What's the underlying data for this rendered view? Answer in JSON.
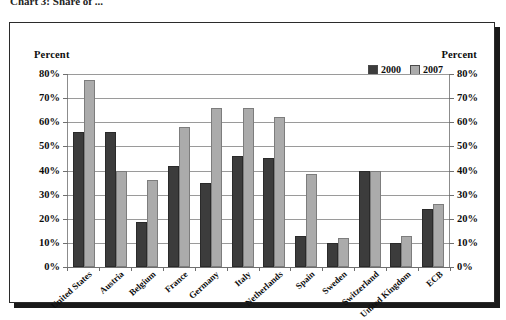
{
  "caption": {
    "clipped_top_text": "Chart 3: Share of ...",
    "visible": true
  },
  "axis_caption": {
    "left": "Percent",
    "right": "Percent"
  },
  "legend": {
    "position": "top-right",
    "items": [
      {
        "label": "2000",
        "color": "#3c3c3c",
        "swatch": "legend-swatch-2000"
      },
      {
        "label": "2007",
        "color": "#ababab",
        "swatch": "legend-swatch-2007"
      }
    ]
  },
  "chart_data": {
    "type": "bar",
    "title": "",
    "xlabel": "",
    "ylabel": "Percent",
    "ylim": [
      0,
      80
    ],
    "ytick_labels": [
      "80%",
      "70%",
      "60%",
      "50%",
      "40%",
      "30%",
      "20%",
      "10%",
      "0%"
    ],
    "ytick_values": [
      80,
      70,
      60,
      50,
      40,
      30,
      20,
      10,
      0
    ],
    "grid": true,
    "dual_axis": true,
    "categories": [
      "United States",
      "Austria",
      "Belgium",
      "France",
      "Germany",
      "Italy",
      "Netherlands",
      "Spain",
      "Sweden",
      "Switzerland",
      "United Kingdom",
      "ECB"
    ],
    "series": [
      {
        "name": "2000",
        "color": "#3c3c3c",
        "values": [
          56,
          56,
          18.5,
          42,
          35,
          46,
          45,
          13,
          10,
          40,
          10,
          24
        ]
      },
      {
        "name": "2007",
        "color": "#ababab",
        "values": [
          77.5,
          40,
          36,
          58,
          66,
          66,
          62,
          38.5,
          12,
          40,
          13,
          26
        ]
      }
    ]
  }
}
